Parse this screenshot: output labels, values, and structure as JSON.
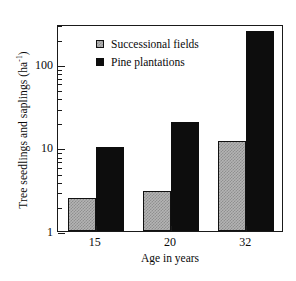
{
  "chart_data": {
    "type": "bar",
    "title": "",
    "xlabel": "Age in years",
    "ylabel": "Tree seedlings and saplings (ha",
    "ylabel_exponent": "-1",
    "ylabel_suffix": ")",
    "categories": [
      "15",
      "20",
      "32"
    ],
    "yscale": "log",
    "ylim": [
      1,
      300
    ],
    "yticks": [
      1,
      10,
      100
    ],
    "ytick_labels": [
      "1",
      "10",
      "100"
    ],
    "grid": false,
    "legend_position": "upper-left-inside",
    "series": [
      {
        "name": "Successional fields",
        "color": "#b4b4b4",
        "values": [
          2.5,
          3.0,
          12.0
        ]
      },
      {
        "name": "Pine plantations",
        "color": "#0d0d0d",
        "values": [
          10.2,
          20.0,
          250.0
        ]
      }
    ]
  },
  "legend": {
    "items": [
      {
        "label": "Successional fields",
        "swatch": "gray"
      },
      {
        "label": "Pine plantations",
        "swatch": "black"
      }
    ]
  },
  "axes": {
    "y_title_main": "Tree seedlings and saplings (ha",
    "y_title_exp": "-1",
    "y_title_end": ")",
    "x_title": "Age in years"
  }
}
